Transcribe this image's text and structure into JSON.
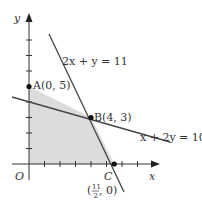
{
  "figure": {
    "type": "linear-programming-feasible-region",
    "axes": {
      "x_label": "x",
      "y_label": "y",
      "origin_label": "O"
    },
    "lines": [
      {
        "equation": "2x + y = 11",
        "label": "2x + y = 11"
      },
      {
        "equation": "x + 2y = 10",
        "label": "x + 2y = 10"
      }
    ],
    "points": [
      {
        "name": "A",
        "coords": "(0, 5)",
        "label": "A(0, 5)"
      },
      {
        "name": "B",
        "coords": "(4, 3)",
        "label": "B(4, 3)"
      },
      {
        "name": "C",
        "coords": "(11/2, 0)",
        "label": "C",
        "coord_label_num": "11",
        "coord_label_den": "2",
        "coord_label_rest": ", 0)",
        "coord_label_open": "("
      }
    ],
    "shaded_region": "Polygon O-A-B-C (feasible region)",
    "colors": {
      "shade": "#d9d9d9",
      "lines": "#444444",
      "axes": "#333333",
      "points": "#111111"
    }
  }
}
